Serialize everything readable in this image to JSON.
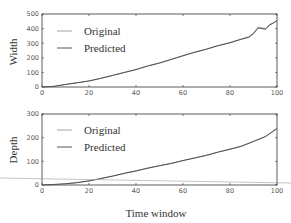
{
  "chart_data": [
    {
      "type": "line",
      "title": "",
      "xlabel": "",
      "ylabel": "Width",
      "xlim": [
        0,
        100
      ],
      "ylim": [
        0,
        500
      ],
      "xticks": [
        0,
        20,
        40,
        60,
        80,
        100
      ],
      "yticks": [
        0,
        100,
        200,
        300,
        400,
        500
      ],
      "grid": false,
      "legend_position": "upper left",
      "x": [
        0,
        5,
        10,
        15,
        20,
        25,
        30,
        35,
        40,
        45,
        50,
        55,
        60,
        65,
        70,
        75,
        80,
        85,
        88,
        90,
        92,
        95,
        97,
        99,
        100
      ],
      "series": [
        {
          "name": "Original",
          "color": "#9a9a9a",
          "values": [
            0,
            5,
            18,
            30,
            42,
            60,
            80,
            100,
            120,
            145,
            165,
            190,
            215,
            240,
            260,
            285,
            305,
            330,
            345,
            370,
            410,
            400,
            430,
            440,
            460
          ]
        },
        {
          "name": "Predicted",
          "color": "#444444",
          "values": [
            0,
            4,
            17,
            29,
            41,
            59,
            79,
            99,
            119,
            144,
            164,
            189,
            214,
            238,
            259,
            283,
            303,
            328,
            340,
            365,
            405,
            395,
            425,
            445,
            455
          ]
        }
      ]
    },
    {
      "type": "line",
      "title": "",
      "xlabel": "Time window",
      "ylabel": "Depth",
      "xlim": [
        0,
        100
      ],
      "ylim": [
        0,
        300
      ],
      "xticks": [
        0,
        20,
        40,
        60,
        80,
        100
      ],
      "yticks": [
        0,
        100,
        200,
        300
      ],
      "grid": false,
      "legend_position": "upper left",
      "x": [
        0,
        5,
        10,
        15,
        20,
        25,
        30,
        35,
        40,
        45,
        50,
        55,
        60,
        65,
        70,
        75,
        80,
        85,
        90,
        95,
        100
      ],
      "series": [
        {
          "name": "Original",
          "color": "#9a9a9a",
          "values": [
            0,
            2,
            5,
            10,
            18,
            28,
            38,
            50,
            60,
            72,
            82,
            92,
            104,
            115,
            126,
            140,
            152,
            165,
            185,
            205,
            240
          ]
        },
        {
          "name": "Predicted",
          "color": "#444444",
          "values": [
            0,
            2,
            5,
            10,
            17,
            27,
            37,
            49,
            59,
            71,
            81,
            91,
            103,
            114,
            125,
            139,
            151,
            164,
            184,
            204,
            238
          ]
        }
      ]
    }
  ],
  "legend": {
    "original": "Original",
    "predicted": "Predicted"
  },
  "axes": {
    "top_ylabel": "Width",
    "bottom_ylabel": "Depth",
    "xlabel": "Time window"
  }
}
